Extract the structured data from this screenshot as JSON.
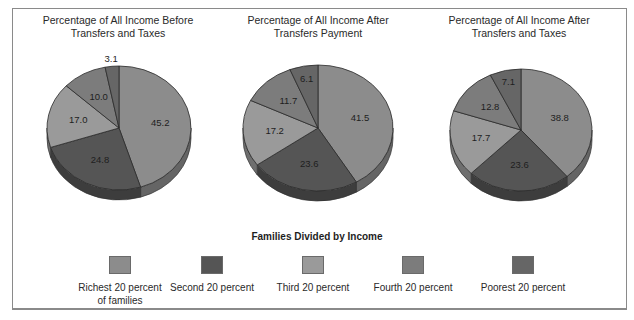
{
  "chart_data": [
    {
      "type": "pie",
      "title": "Percentage of All Income Before Transfers and Taxes",
      "title_lines": [
        "Percentage of All Income Before",
        "Transfers and Taxes"
      ],
      "categories": [
        "Richest 20 percent of families",
        "Second 20 percent",
        "Third 20 percent",
        "Fourth 20 percent",
        "Poorest 20 percent"
      ],
      "values": [
        45.2,
        24.8,
        17.0,
        10.0,
        3.1
      ],
      "labels": [
        "45.2",
        "24.8",
        "17.0",
        "10.0",
        "3.1"
      ]
    },
    {
      "type": "pie",
      "title": "Percentage of All Income After Transfers Payment",
      "title_lines": [
        "Percentage of All Income After",
        "Transfers Payment"
      ],
      "categories": [
        "Richest 20 percent of families",
        "Second 20 percent",
        "Third 20 percent",
        "Fourth 20 percent",
        "Poorest 20 percent"
      ],
      "values": [
        41.5,
        23.6,
        17.2,
        11.7,
        6.1
      ],
      "labels": [
        "41.5",
        "23.6",
        "17.2",
        "11.7",
        "6.1"
      ]
    },
    {
      "type": "pie",
      "title": "Percentage of All Income After Transfers and Taxes",
      "title_lines": [
        "Percentage of All Income After",
        "Transfers and Taxes"
      ],
      "categories": [
        "Richest 20 percent of families",
        "Second 20 percent",
        "Third 20 percent",
        "Fourth 20 percent",
        "Poorest 20 percent"
      ],
      "values": [
        38.8,
        23.6,
        17.7,
        12.8,
        7.1
      ],
      "labels": [
        "38.8",
        "23.6",
        "17.7",
        "12.8",
        "7.1"
      ]
    }
  ],
  "legend": {
    "title": "Families Divided by Income",
    "position": "bottom",
    "items": [
      {
        "label": "Richest 20 percent of families",
        "line1": "Richest 20 percent",
        "line2": "of families",
        "color": "#8c8c8c"
      },
      {
        "label": "Second 20 percent",
        "line1": "Second 20 percent",
        "line2": "",
        "color": "#555555"
      },
      {
        "label": "Third 20 percent",
        "line1": "Third 20 percent",
        "line2": "",
        "color": "#9a9a9a"
      },
      {
        "label": "Fourth 20 percent",
        "line1": "Fourth 20 percent",
        "line2": "",
        "color": "#7c7c7c"
      },
      {
        "label": "Poorest 20 percent",
        "line1": "Poorest 20 percent",
        "line2": "",
        "color": "#666666"
      }
    ]
  }
}
